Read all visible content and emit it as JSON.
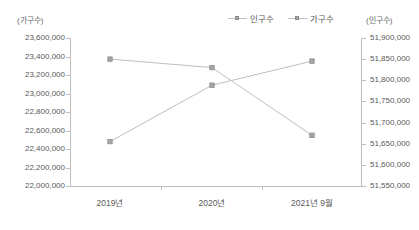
{
  "chart_data": {
    "type": "line",
    "title": "",
    "xlabel": "",
    "categories": [
      "2019년",
      "2020년",
      "2021년 9월"
    ],
    "grid": false,
    "legend_position": "top-center",
    "series": [
      {
        "name": "인구수",
        "axis": "right",
        "values": [
          51850000,
          51830000,
          51670000
        ],
        "color": "#bfbfbf",
        "marker": "square"
      },
      {
        "name": "가구수",
        "axis": "left",
        "values": [
          22480000,
          23090000,
          23350000
        ],
        "color": "#bfbfbf",
        "marker": "square"
      }
    ],
    "left_axis": {
      "title": "(가구수)",
      "ylim": [
        22000000,
        23600000
      ],
      "tick_step": 200000,
      "ticks": [
        "23,600,000",
        "23,400,000",
        "23,200,000",
        "23,000,000",
        "22,800,000",
        "22,600,000",
        "22,400,000",
        "22,200,000",
        "22,000,000"
      ]
    },
    "right_axis": {
      "title": "(인구수)",
      "ylim": [
        51550000,
        51900000
      ],
      "tick_step": 50000,
      "ticks": [
        "51,900,000",
        "51,850,000",
        "51,800,000",
        "51,750,000",
        "51,700,000",
        "51,650,000",
        "51,600,000",
        "51,550,000"
      ]
    }
  },
  "legend": {
    "items": [
      {
        "label": "인구수"
      },
      {
        "label": "가구수"
      }
    ]
  }
}
